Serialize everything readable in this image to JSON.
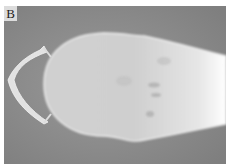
{
  "figure": {
    "panel_label": "B",
    "colors": {
      "background": "#8e8e8e",
      "skull": "#d4d4d4",
      "holder": "#e2e2e2",
      "bright_region": "#ffffff"
    }
  }
}
